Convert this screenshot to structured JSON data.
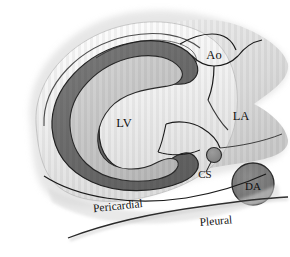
{
  "figure": {
    "type": "anatomical-illustration",
    "background_color": "#ffffff"
  },
  "labels": {
    "aorta": "Ao",
    "left_atrium": "LA",
    "left_ventricle": "LV",
    "coronary_sinus": "CS",
    "descending_aorta": "DA",
    "pericardial": "Pericardial",
    "pleural": "Pleural"
  },
  "colors": {
    "myocardium": "#6e6e6e",
    "cavity": "#c9c9c9",
    "pericardium": "#e8e8e8",
    "soft_tissue": "#d5d5d5",
    "descending_aorta_fill": "#7a7a7a",
    "coronary_sinus_fill": "#8a8a8a",
    "outline": "#1a1a1a",
    "label_text": "#111111"
  }
}
